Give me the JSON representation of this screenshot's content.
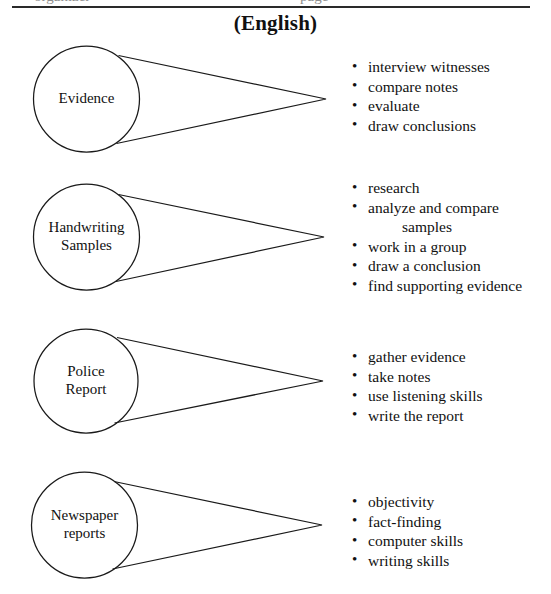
{
  "document": {
    "title": "(English)",
    "partial_text_above_rule_left": "organizer",
    "partial_text_above_rule_right": "page",
    "ink_color": "#1a1a1a",
    "paper_color": "#ffffff"
  },
  "sections": [
    {
      "id": "evidence",
      "circle_label": "Evidence",
      "bullets": [
        {
          "text": "interview witnesses",
          "continuation": false
        },
        {
          "text": "compare notes",
          "continuation": false
        },
        {
          "text": "evaluate",
          "continuation": false
        },
        {
          "text": "draw conclusions",
          "continuation": false
        }
      ]
    },
    {
      "id": "handwriting-samples",
      "circle_label": "Handwriting\nSamples",
      "bullets": [
        {
          "text": "research",
          "continuation": false
        },
        {
          "text": "analyze and compare",
          "continuation": false
        },
        {
          "text": "samples",
          "continuation": true
        },
        {
          "text": "work in a group",
          "continuation": false
        },
        {
          "text": "draw a conclusion",
          "continuation": false
        },
        {
          "text": "find supporting evidence",
          "continuation": false
        }
      ]
    },
    {
      "id": "police-report",
      "circle_label": "Police\nReport",
      "bullets": [
        {
          "text": "gather evidence",
          "continuation": false
        },
        {
          "text": "take notes",
          "continuation": false
        },
        {
          "text": "use listening skills",
          "continuation": false
        },
        {
          "text": "write the report",
          "continuation": false
        }
      ]
    },
    {
      "id": "newspaper-reports",
      "circle_label": "Newspaper\nreports",
      "bullets": [
        {
          "text": "objectivity",
          "continuation": false
        },
        {
          "text": "fact-finding",
          "continuation": false
        },
        {
          "text": "computer skills",
          "continuation": false
        },
        {
          "text": "writing skills",
          "continuation": false
        }
      ]
    }
  ]
}
